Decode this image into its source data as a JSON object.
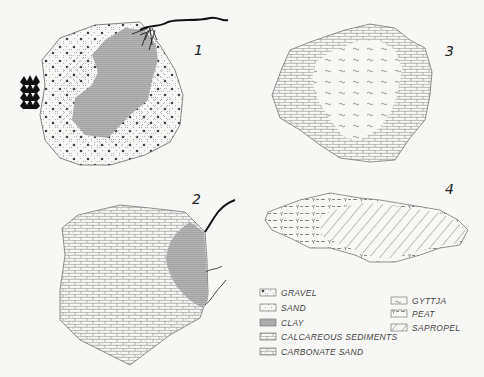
{
  "figure": {
    "panels": [
      {
        "label": "1",
        "description": "Lake with gravel margin, sand zone and central clay; inflowing stream with delta on NE, vegetation on W"
      },
      {
        "label": "2",
        "description": "Lake with carbonate sand / calcareous sediments and clay near inflowing streams on E"
      },
      {
        "label": "3",
        "description": "Lake with calcareous sediment margin and central gyttja"
      },
      {
        "label": "4",
        "description": "Elongated lake with peat margin and sapropel center"
      }
    ],
    "legend": {
      "col1": [
        {
          "key": "gravel",
          "label": "GRAVEL"
        },
        {
          "key": "sand",
          "label": "SAND"
        },
        {
          "key": "clay",
          "label": "CLAY"
        },
        {
          "key": "calcareous",
          "label": "CALCAREOUS  SEDIMENTS"
        },
        {
          "key": "carbonate_sand",
          "label": "CARBONATE  SAND"
        }
      ],
      "col2": [
        {
          "key": "gyttja",
          "label": "GYTTJA"
        },
        {
          "key": "peat",
          "label": "PEAT"
        },
        {
          "key": "sapropel",
          "label": "SAPROPEL"
        }
      ]
    }
  },
  "colors": {
    "background": "#f7f7f5",
    "line": "#555555",
    "clay": "#a9a9a9",
    "ink": "#111111"
  }
}
